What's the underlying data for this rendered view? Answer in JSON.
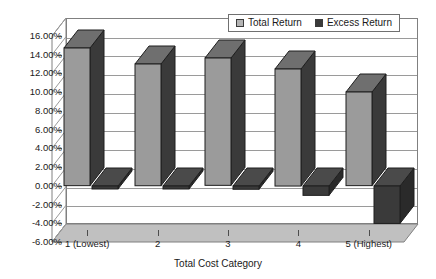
{
  "chart_data": {
    "type": "bar",
    "title": "",
    "xlabel": "Total Cost Category",
    "ylabel": "",
    "categories": [
      "1 (Lowest)",
      "2",
      "3",
      "4",
      "5 (Highest)"
    ],
    "series": [
      {
        "name": "Total Return",
        "color": "#9b9b9b",
        "values": [
          0.147,
          0.13,
          0.136,
          0.125,
          0.1
        ]
      },
      {
        "name": "Excess Return",
        "color": "#3a3a3a",
        "values": [
          -0.003,
          -0.003,
          -0.0035,
          -0.01,
          -0.04
        ]
      }
    ],
    "ylim": [
      -0.06,
      0.16
    ],
    "ytick_labels": [
      "16.00%",
      "14.00%",
      "12.00%",
      "10.00%",
      "8.00%",
      "6.00%",
      "4.00%",
      "2.00%",
      "0.00%",
      "-2.00%",
      "-4.00%",
      "-6.00%"
    ],
    "ytick_values": [
      0.16,
      0.14,
      0.12,
      0.1,
      0.08,
      0.06,
      0.04,
      0.02,
      0.0,
      -0.02,
      -0.04,
      -0.06
    ],
    "grid": true,
    "legend_position": "top-right",
    "style": "3d-column"
  },
  "legend": {
    "items": [
      {
        "label": "Total Return"
      },
      {
        "label": "Excess Return"
      }
    ]
  },
  "axes": {
    "x_title": "Total Cost Category"
  },
  "colors": {
    "bar_total_face": "#9b9b9b",
    "bar_total_side": "#3a3a3a",
    "bar_excess_face": "#3a3a3a",
    "floor": "#c0c0c0",
    "gridline": "#9a9a9a",
    "wall_border": "#808080",
    "text": "#1a1a1a",
    "background": "#ffffff"
  }
}
